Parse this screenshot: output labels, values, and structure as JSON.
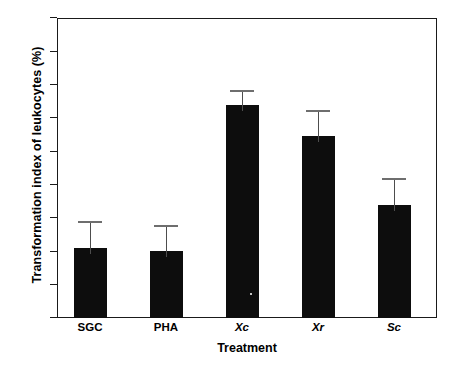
{
  "chart_data": {
    "type": "bar",
    "title": "",
    "xlabel": "Treatment",
    "ylabel": "Transformation index of leukocytes (%)",
    "categories": [
      "SGC",
      "PHA",
      "Xc",
      "Xr",
      "Sc"
    ],
    "categories_italic": [
      false,
      false,
      true,
      true,
      true
    ],
    "values": [
      62.2,
      62.0,
      70.8,
      68.9,
      64.8
    ],
    "error_upper": [
      1.6,
      1.6,
      0.9,
      1.6,
      1.6
    ],
    "error_top_values": [
      63.8,
      63.6,
      71.7,
      70.5,
      66.4
    ],
    "error_type": "upper-only",
    "ylim": [
      58,
      76
    ],
    "yticks": [
      58,
      60,
      62,
      64,
      66,
      68,
      70,
      72,
      74,
      76
    ],
    "ytick_labels": [
      "58",
      "60",
      "62",
      "64",
      "66",
      "68",
      "70",
      "72",
      "74",
      "76"
    ],
    "grid": false,
    "legend": null,
    "bar_color": "#0d0d0d",
    "error_color": "#6e6e6e",
    "axis_color": "#1a1a1a"
  }
}
